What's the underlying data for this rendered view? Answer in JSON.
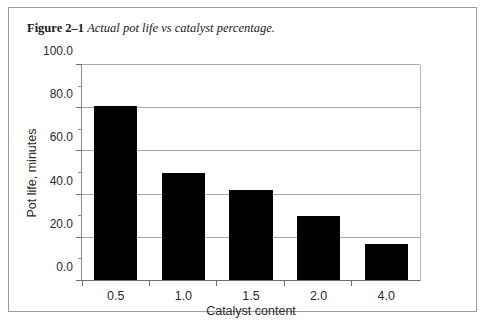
{
  "caption": {
    "label": "Figure 2–1",
    "text": "Actual pot life vs catalyst percentage."
  },
  "chart_data": {
    "type": "bar",
    "title": "",
    "categories": [
      "0.5",
      "1.0",
      "1.5",
      "2.0",
      "4.0"
    ],
    "values": [
      81,
      50,
      42,
      30,
      17
    ],
    "series": [
      {
        "name": "Pot life",
        "values": [
          81,
          50,
          42,
          30,
          17
        ]
      }
    ],
    "xlabel": "Catalyst content",
    "ylabel": "Pot life, minutes",
    "ylim": [
      0,
      100
    ],
    "ytick_labels": [
      "0.0",
      "20.0",
      "40.0",
      "60.0",
      "80.0",
      "100.0"
    ],
    "ytick_values": [
      0,
      20,
      40,
      60,
      80,
      100
    ],
    "yminor_values": [
      10,
      30,
      50,
      70,
      90
    ],
    "grid": "horizontal-major",
    "legend": "none",
    "bar_color": "#000000"
  }
}
